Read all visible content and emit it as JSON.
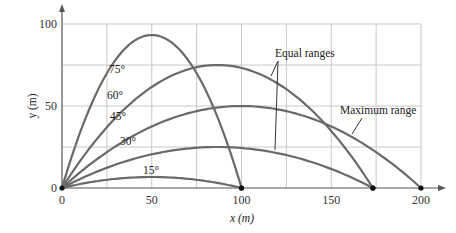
{
  "chart_data": {
    "type": "line",
    "title": "",
    "xlabel": "x (m)",
    "ylabel": "y (m)",
    "xlim": [
      0,
      200
    ],
    "ylim": [
      0,
      100
    ],
    "xticks": [
      0,
      50,
      100,
      150,
      200
    ],
    "yticks": [
      0,
      50,
      100
    ],
    "grid": true,
    "grid_step": 25,
    "range_factor_v2_over_g": 200,
    "series": [
      {
        "name": "75°",
        "angle_deg": 75,
        "range": 100,
        "max_height": 93.3
      },
      {
        "name": "60°",
        "angle_deg": 60,
        "range": 173.2,
        "max_height": 75
      },
      {
        "name": "45°",
        "angle_deg": 45,
        "range": 200,
        "max_height": 50
      },
      {
        "name": "30°",
        "angle_deg": 30,
        "range": 173.2,
        "max_height": 25
      },
      {
        "name": "15°",
        "angle_deg": 15,
        "range": 100,
        "max_height": 6.7
      }
    ],
    "annotations": [
      {
        "text": "Equal ranges",
        "points_to": [
          "60°",
          "30°"
        ]
      },
      {
        "text": "Maximum range",
        "points_to": [
          "45°"
        ]
      }
    ]
  }
}
